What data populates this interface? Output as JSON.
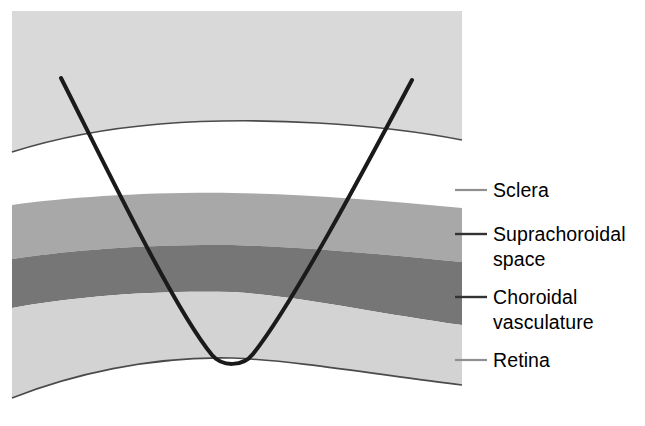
{
  "figure": {
    "type": "anatomical-cross-section-diagram"
  },
  "colors": {
    "background": "#ffffff",
    "sclera_outer_tissue": "#d9d9d9",
    "sclera_band": "#ffffff",
    "suprachoroidal_space_band": "#a8a8a8",
    "choroidal_vasculature_band": "#767676",
    "retina_band": "#d3d3d3",
    "boundary_line": "#3a3a3a",
    "catheter_curve": "#1a1a1a",
    "leader_line": "#888888",
    "leader_line_dark": "#333333",
    "label_text": "#000000"
  },
  "layers": [
    {
      "id": "sclera",
      "label": "Sclera",
      "fill": "#ffffff"
    },
    {
      "id": "suprachoroidal-space",
      "label": "Suprachoroidal\nspace",
      "fill": "#a8a8a8"
    },
    {
      "id": "choroidal-vasculature",
      "label": "Choroidal\nvasculature",
      "fill": "#767676"
    },
    {
      "id": "retina",
      "label": "Retina",
      "fill": "#d3d3d3"
    }
  ],
  "labels": {
    "sclera": "Sclera",
    "suprachoroidal_space": "Suprachoroidal\nspace",
    "choroidal_vasculature": "Choroidal\nvasculature",
    "retina": "Retina"
  },
  "catheter": {
    "name": "suprachoroidal catheter",
    "left_tip": {
      "x": 61,
      "y": 78
    },
    "right_tip": {
      "x": 412,
      "y": 80
    },
    "apex": {
      "x": 232,
      "y": 366
    },
    "stroke_width": 4
  },
  "leader_lines": [
    {
      "target": "sclera",
      "x1": 455,
      "x2": 487,
      "y": 190,
      "shade": "light"
    },
    {
      "target": "suprachoroidal-space",
      "x1": 455,
      "x2": 487,
      "y": 234,
      "shade": "dark"
    },
    {
      "target": "choroidal-vasculature",
      "x1": 455,
      "x2": 487,
      "y": 297,
      "shade": "dark"
    },
    {
      "target": "retina",
      "x1": 455,
      "x2": 487,
      "y": 360,
      "shade": "light"
    }
  ]
}
